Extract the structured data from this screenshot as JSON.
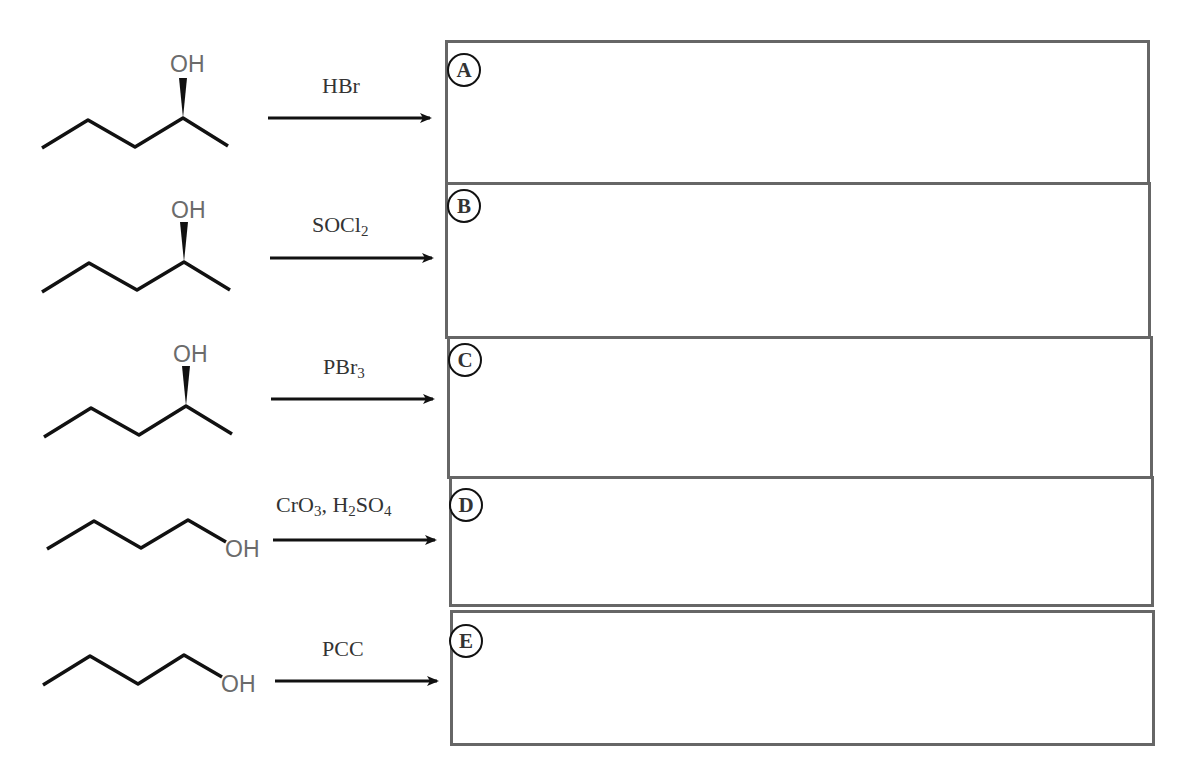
{
  "reactions": [
    {
      "id": "A",
      "starting_material": {
        "name": "(S)-2-pentanol",
        "oh_label": "OH",
        "type": "secondary-alcohol-wedge"
      },
      "reagent": {
        "parts": [
          {
            "t": "HBr"
          }
        ],
        "text": "HBr"
      },
      "answer_box_label": "A"
    },
    {
      "id": "B",
      "starting_material": {
        "name": "2-pentanol",
        "oh_label": "OH",
        "type": "secondary-alcohol-wedge"
      },
      "reagent": {
        "parts": [
          {
            "t": "SOCl"
          },
          {
            "sub": "2"
          }
        ],
        "text": "SOCl2",
        "main": "SOCl",
        "sub": "2"
      },
      "answer_box_label": "B"
    },
    {
      "id": "C",
      "starting_material": {
        "name": "2-pentanol",
        "oh_label": "OH",
        "type": "secondary-alcohol-wedge"
      },
      "reagent": {
        "text": "PBr3",
        "main": "PBr",
        "sub": "3"
      },
      "answer_box_label": "C"
    },
    {
      "id": "D",
      "starting_material": {
        "name": "1-pentanol",
        "oh_label": "OH",
        "type": "primary-alcohol"
      },
      "reagent": {
        "text": "CrO3, H2SO4",
        "p1": "CrO",
        "s1": "3",
        "p2": ", H",
        "s2": "2",
        "p3": "SO",
        "s3": "4"
      },
      "answer_box_label": "D"
    },
    {
      "id": "E",
      "starting_material": {
        "name": "1-pentanol",
        "oh_label": "OH",
        "type": "primary-alcohol"
      },
      "reagent": {
        "text": "PCC",
        "main": "PCC"
      },
      "answer_box_label": "E"
    }
  ],
  "colors": {
    "bond": "#111111",
    "heteroatom": "#6b6b6b",
    "box_border": "#666666",
    "text": "#333333"
  }
}
